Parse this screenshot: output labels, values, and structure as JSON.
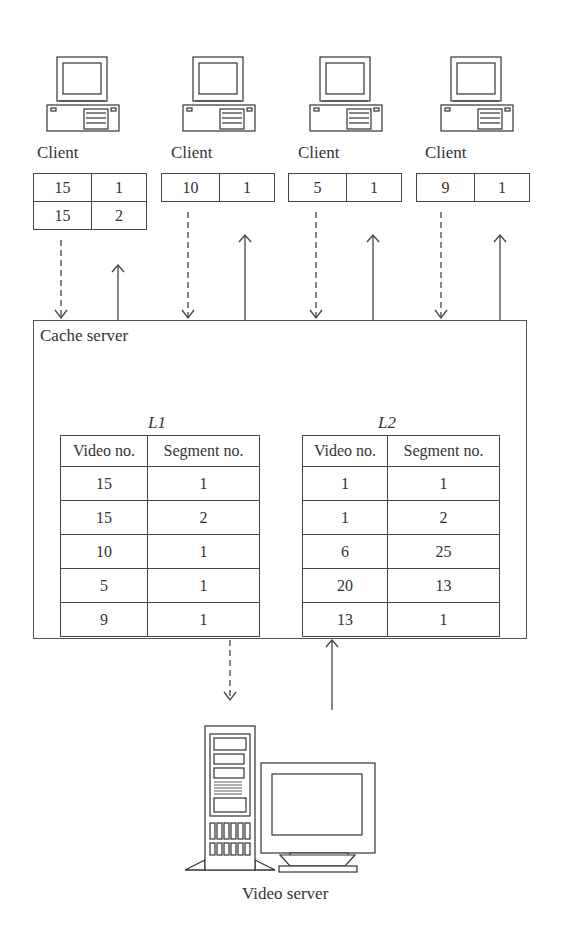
{
  "clients": [
    {
      "label": "Client",
      "requests": [
        [
          "15",
          "1"
        ],
        [
          "15",
          "2"
        ]
      ]
    },
    {
      "label": "Client",
      "requests": [
        [
          "10",
          "1"
        ]
      ]
    },
    {
      "label": "Client",
      "requests": [
        [
          "5",
          "1"
        ]
      ]
    },
    {
      "label": "Client",
      "requests": [
        [
          "9",
          "1"
        ]
      ]
    }
  ],
  "cache_server": {
    "label": "Cache server",
    "lists": [
      {
        "title": "L1",
        "headers": [
          "Video no.",
          "Segment no."
        ],
        "rows": [
          [
            "15",
            "1"
          ],
          [
            "15",
            "2"
          ],
          [
            "10",
            "1"
          ],
          [
            "5",
            "1"
          ],
          [
            "9",
            "1"
          ]
        ]
      },
      {
        "title": "L2",
        "headers": [
          "Video no.",
          "Segment no."
        ],
        "rows": [
          [
            "1",
            "1"
          ],
          [
            "1",
            "2"
          ],
          [
            "6",
            "25"
          ],
          [
            "20",
            "13"
          ],
          [
            "13",
            "1"
          ]
        ]
      }
    ]
  },
  "video_server": {
    "label": "Video server"
  },
  "arrows": {
    "request_style": "dashed",
    "response_style": "solid"
  }
}
